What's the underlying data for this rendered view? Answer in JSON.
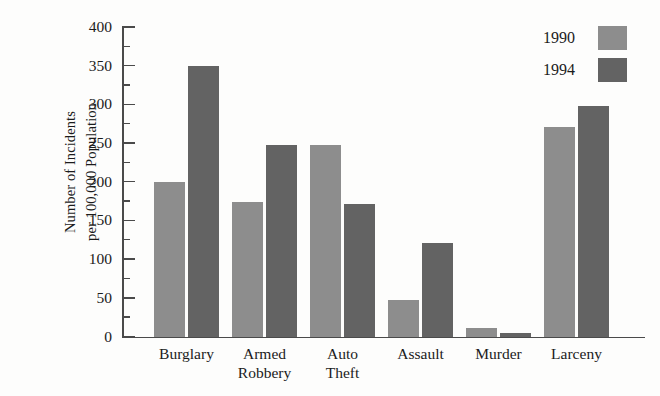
{
  "chart_data": {
    "type": "bar",
    "title": "",
    "xlabel": "",
    "ylabel": "Number of Incidents per 100,000 Population",
    "ylabel_lines": [
      "Number of Incidents",
      "per 100,000 Population"
    ],
    "categories": [
      "Burglary",
      "Armed Robbery",
      "Auto Theft",
      "Assault",
      "Murder",
      "Larceny"
    ],
    "category_lines": [
      [
        "Burglary"
      ],
      [
        "Armed",
        "Robbery"
      ],
      [
        "Auto",
        "Theft"
      ],
      [
        "Assault"
      ],
      [
        "Murder"
      ],
      [
        "Larceny"
      ]
    ],
    "series": [
      {
        "name": "1990",
        "color": "#8d8d8d",
        "values": [
          200,
          175,
          248,
          48,
          12,
          272
        ]
      },
      {
        "name": "1994",
        "color": "#636363",
        "values": [
          350,
          248,
          172,
          122,
          5,
          298
        ]
      }
    ],
    "ylim": [
      0,
      400
    ],
    "ytick_major": [
      0,
      50,
      100,
      150,
      200,
      250,
      300,
      350,
      400
    ],
    "ytick_minor": [
      25,
      75,
      125,
      175,
      225,
      275,
      325,
      375
    ],
    "ytick_labels": [
      "0",
      "50",
      "100",
      "150",
      "200",
      "250",
      "300",
      "350",
      "400"
    ],
    "grid": false,
    "legend_position": "top-right",
    "legend_entries": [
      {
        "label": "1990",
        "color": "#8d8d8d"
      },
      {
        "label": "1994",
        "color": "#636363"
      }
    ]
  }
}
